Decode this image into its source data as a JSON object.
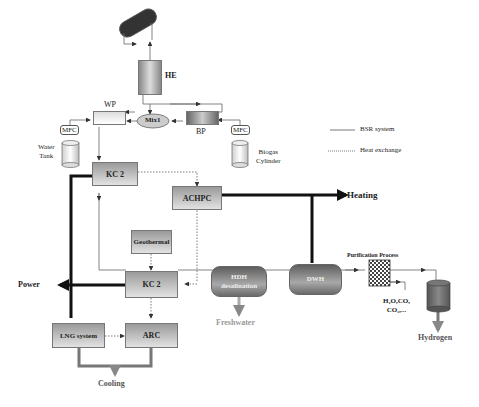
{
  "diagram": {
    "components": {
      "he": "HE",
      "wp": "WP",
      "mix": "Mix1",
      "bp": "BP",
      "mfc_left": "MFC",
      "mfc_right": "MFC",
      "water_tank": "Water\nTank",
      "water_tank_l1": "Water",
      "water_tank_l2": "Tank",
      "biogas_l1": "Biogas",
      "biogas_l2": "Cylinder",
      "kc_top": "KC 2",
      "achpc": "ACHPC",
      "geothermal": "Geothermal",
      "kc_bottom": "KC 2",
      "hdh_l1": "HDH",
      "hdh_l2": "desalination",
      "dwh": "DWH",
      "purification": "Purification Process",
      "byproducts_l1": "H₂O,CO,",
      "byproducts_l2": "CO₂,...",
      "lng": "LNG system",
      "arc": "ARC"
    },
    "outputs": {
      "heating": "Heating",
      "power": "Power",
      "freshwater": "Freshwater",
      "hydrogen": "Hydrogen",
      "cooling": "Cooling"
    },
    "legend": {
      "solid": "BSR system",
      "dotted": "Heat exchange"
    },
    "colors": {
      "line": "#555555",
      "thick": "#111111",
      "output_gray": "#888888",
      "box_dark": "#9a9a9a",
      "box_light": "#e2e2e2"
    }
  }
}
